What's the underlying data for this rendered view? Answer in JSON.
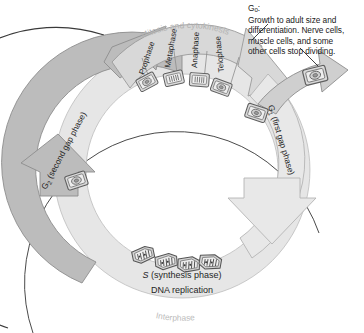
{
  "diagram": {
    "center_label": "",
    "cycle_direction_arrow": "counterclockwise-outer-arrow",
    "bands": {
      "mitosis": {
        "label": "Mitosis and cytokinesis",
        "color": "#d6d6d6",
        "phases": [
          {
            "label": "Prophase",
            "cell_icon": "cell-prophase-icon"
          },
          {
            "label": "Metaphase",
            "cell_icon": "cell-metaphase-icon"
          },
          {
            "label": "Anaphase",
            "cell_icon": "cell-anaphase-icon"
          },
          {
            "label": "Telophase",
            "cell_icon": "cell-telophase-icon"
          }
        ]
      },
      "g2": {
        "label": "G₂ (second gap phase)",
        "label_main": "G",
        "label_sub": "2",
        "label_rest": " (second gap phase)",
        "color": "#b9b9b9",
        "cell_icon": "cell-g2-icon"
      },
      "g1": {
        "label": "G₁ (first gap phase)",
        "label_main": "G",
        "label_sub": "1",
        "label_rest": " (first gap phase)",
        "color": "#e4e4e4",
        "cell_icon": "cell-g1-icon"
      },
      "s": {
        "label_italic": "S",
        "label_rest": " (synthesis phase)",
        "sublabel": "DNA replication",
        "color": "#e4e4e4",
        "cell_icons": [
          "cell-s-1-icon",
          "cell-s-2-icon",
          "cell-s-3-icon",
          "cell-s-4-icon"
        ]
      },
      "interphase": {
        "label": "Interphase",
        "color": "#bdbdbd"
      }
    },
    "g0": {
      "title": "G",
      "title_sub": "0",
      "title_colon": ":",
      "lines": [
        "Growth to adult  size and",
        "differentiation. Nerve cells,",
        "muscle cells, and some",
        "other cells stop dividing."
      ],
      "cell_icon": "cell-g0-icon",
      "branch_arrow": "g0-branch-arrow"
    },
    "colors": {
      "dark_band": "#b9b9b9",
      "mid_band": "#d6d6d6",
      "light_band": "#e4e4e4",
      "outline": "#6f6f6f",
      "text": "#1a1a1a",
      "faint_text": "#b0b0b0",
      "cell_fill": "#d9d9d9",
      "background": "#ffffff"
    }
  }
}
